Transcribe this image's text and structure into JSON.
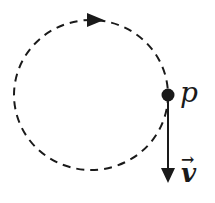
{
  "diagram": {
    "point_label": "p",
    "velocity_label": "v",
    "velocity_arrow_glyph": "→",
    "path_style": "dashed circle",
    "motion_direction": "clockwise",
    "colors": {
      "stroke": "#1a1a1a",
      "background": "#ffffff"
    }
  }
}
